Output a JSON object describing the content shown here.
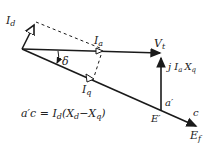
{
  "diagram": {
    "labels": {
      "Id": "I",
      "Id_sub": "d",
      "Ia": "I",
      "Ia_sub": "a",
      "Iq": "I",
      "Iq_sub": "q",
      "Vt": "V",
      "Vt_sub": "t",
      "jIaXq": "j I",
      "jIaXq_sub1": "a",
      "jIaXq_X": "X",
      "jIaXq_sub2": "q",
      "delta": "δ",
      "a_prime": "a′",
      "c": "c",
      "E_prime": "E′",
      "Ef": "E",
      "Ef_sub": "f"
    },
    "equation": {
      "lhs": "a′c = I",
      "lhs_sub": "d",
      "mid": "(X",
      "mid_sub": "d",
      "minus": "−X",
      "minus_sub": "q",
      "close": ")"
    },
    "colors": {
      "line": "#1a1a1a",
      "background": "#ffffff"
    }
  }
}
